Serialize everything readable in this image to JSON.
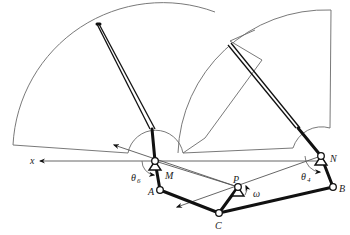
{
  "figure": {
    "labels": {
      "x_axis": "x",
      "M": "M",
      "N": "N",
      "A": "A",
      "B": "B",
      "C": "C",
      "P": "P",
      "omega": "ω",
      "theta6": "θ",
      "theta6_sub": "6",
      "theta4": "θ",
      "theta4_sub": "4"
    },
    "points": {
      "M": [
        155,
        161
      ],
      "N": [
        321,
        156
      ],
      "A": [
        160,
        190
      ],
      "B": [
        333,
        187
      ],
      "C": [
        219,
        213
      ],
      "P": [
        238,
        187
      ]
    },
    "colors": {
      "link": "#111111",
      "construction": "#6a6a6a",
      "background": "#ffffff"
    }
  }
}
